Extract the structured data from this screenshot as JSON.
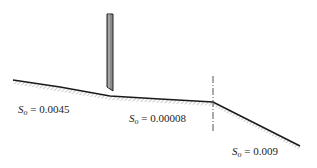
{
  "diagram": {
    "type": "open-channel-profile",
    "elements": {
      "gate": {
        "name": "sluice-gate",
        "fill": "#8a8a8a",
        "stroke": "#222222"
      },
      "break_line": {
        "name": "slope-break-marker",
        "style": "dash-dot"
      }
    },
    "reaches": [
      {
        "id": "reach-1",
        "label_symbol": "S",
        "label_sub": "o",
        "label_value": " = 0.0045"
      },
      {
        "id": "reach-2",
        "label_symbol": "S",
        "label_sub": "o",
        "label_value": " = 0.00008"
      },
      {
        "id": "reach-3",
        "label_symbol": "S",
        "label_sub": "o",
        "label_value": " = 0.009"
      }
    ],
    "colors": {
      "bed_line": "#1a1a1a",
      "hatch": "#9a9a9a",
      "gate_fill": "#8a8a8a"
    }
  }
}
